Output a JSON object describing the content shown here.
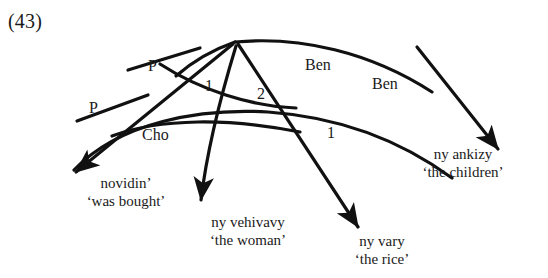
{
  "figure": {
    "example_number": "(43)",
    "language_note": "",
    "type": "arc-pair-grammar-diagram"
  },
  "arc_labels": [
    {
      "id": "p-outer",
      "text": "P",
      "x": 89,
      "y": 100
    },
    {
      "id": "p-inner",
      "text": "P",
      "x": 148,
      "y": 58
    },
    {
      "id": "cho",
      "text": "Cho",
      "x": 142,
      "y": 127
    },
    {
      "id": "one-upper",
      "text": "1",
      "x": 205,
      "y": 78
    },
    {
      "id": "two",
      "text": "2",
      "x": 257,
      "y": 86
    },
    {
      "id": "ben-upper",
      "text": "Ben",
      "x": 305,
      "y": 57
    },
    {
      "id": "ben-lower",
      "text": "Ben",
      "x": 372,
      "y": 76
    },
    {
      "id": "one-lower",
      "text": "1",
      "x": 327,
      "y": 125
    }
  ],
  "terminals": [
    {
      "id": "novidin",
      "form": "novidin’",
      "meaning": "‘was bought’",
      "x": 68,
      "y": 175,
      "width": 116
    },
    {
      "id": "ny-vehivavy",
      "form": "ny vehivavy",
      "meaning": "‘the woman’",
      "x": 188,
      "y": 214,
      "width": 120
    },
    {
      "id": "ny-vary",
      "form": "ny vary",
      "meaning": "‘the rice’",
      "x": 332,
      "y": 233,
      "width": 100
    },
    {
      "id": "ny-ankizy",
      "form": "ny ankizy",
      "meaning": "‘the children’",
      "x": 393,
      "y": 146,
      "width": 140
    }
  ],
  "colors": {
    "ink": "#111111",
    "background": "#ffffff"
  }
}
